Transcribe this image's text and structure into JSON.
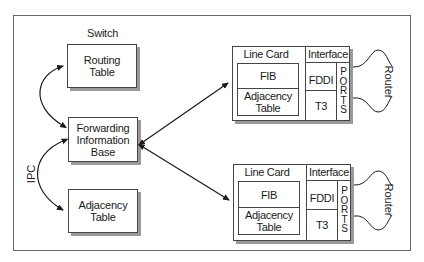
{
  "diagram": {
    "switch_label": "Switch",
    "ipc_label": "IPC",
    "switch_components": [
      {
        "id": "routing-table",
        "lines": [
          "Routing",
          "Table"
        ]
      },
      {
        "id": "fib",
        "lines": [
          "Forwarding",
          "Information",
          "Base"
        ]
      },
      {
        "id": "adjacency-table",
        "lines": [
          "Adjacency",
          "Table"
        ]
      }
    ],
    "line_cards": [
      {
        "title": "Line Card",
        "fib": "FIB",
        "adjacency": [
          "Adjacency",
          "Table"
        ],
        "interface_title": "Interface",
        "interfaces": [
          "FDDI",
          "T3"
        ],
        "ports": [
          "P",
          "O",
          "R",
          "T",
          "S"
        ],
        "router_label": "Router"
      },
      {
        "title": "Line Card",
        "fib": "FIB",
        "adjacency": [
          "Adjacency",
          "Table"
        ],
        "interface_title": "Interface",
        "interfaces": [
          "FDDI",
          "T3"
        ],
        "ports": [
          "P",
          "O",
          "R",
          "T",
          "S"
        ],
        "router_label": "Router"
      }
    ],
    "colors": {
      "line": "#1a1a1a",
      "shadow": "#9a9a9a",
      "frame": "#6a6a6a"
    }
  }
}
